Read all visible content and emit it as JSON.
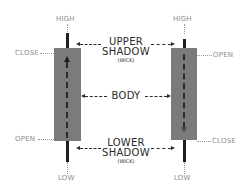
{
  "diagram": {
    "colors": {
      "body": "#7b7b7b",
      "wick": "#1e1e1e",
      "label": "#8c8c8c",
      "center_label": "#2a2a2a"
    },
    "bullish_candle": {
      "high_label": "HIGH",
      "low_label": "LOW",
      "top_label": "CLOSE",
      "bottom_label": "OPEN",
      "direction": "up"
    },
    "bearish_candle": {
      "high_label": "HIGH",
      "low_label": "LOW",
      "top_label": "OPEN",
      "bottom_label": "CLOSE",
      "direction": "down"
    },
    "center_labels": {
      "upper_shadow_line1": "UPPER",
      "upper_shadow_line2": "SHADOW",
      "upper_shadow_sub": "(WICK)",
      "body": "BODY",
      "lower_shadow_line1": "LOWER",
      "lower_shadow_line2": "SHADOW",
      "lower_shadow_sub": "(WICK)"
    }
  }
}
